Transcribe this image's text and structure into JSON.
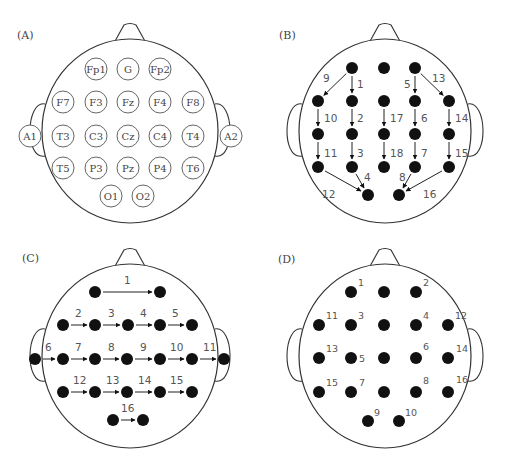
{
  "panels": [
    {
      "id": "A",
      "label": "(A)",
      "label_pos": [
        17,
        39
      ],
      "head": {
        "cx": 130,
        "cy": 131,
        "rx": 88,
        "ry": 92
      },
      "electrodes": [
        {
          "name": "Fp1",
          "x": 96,
          "y": 69
        },
        {
          "name": "G",
          "x": 128,
          "y": 69
        },
        {
          "name": "Fp2",
          "x": 160,
          "y": 69
        },
        {
          "name": "F7",
          "x": 63,
          "y": 102
        },
        {
          "name": "F3",
          "x": 96,
          "y": 102
        },
        {
          "name": "Fz",
          "x": 128,
          "y": 102
        },
        {
          "name": "F4",
          "x": 160,
          "y": 102
        },
        {
          "name": "F8",
          "x": 193,
          "y": 102
        },
        {
          "name": "A1",
          "x": 30,
          "y": 136
        },
        {
          "name": "T3",
          "x": 63,
          "y": 136
        },
        {
          "name": "C3",
          "x": 96,
          "y": 136
        },
        {
          "name": "Cz",
          "x": 128,
          "y": 136
        },
        {
          "name": "C4",
          "x": 160,
          "y": 136
        },
        {
          "name": "T4",
          "x": 193,
          "y": 136
        },
        {
          "name": "A2",
          "x": 231,
          "y": 136
        },
        {
          "name": "T5",
          "x": 63,
          "y": 168
        },
        {
          "name": "P3",
          "x": 96,
          "y": 168
        },
        {
          "name": "Pz",
          "x": 128,
          "y": 168
        },
        {
          "name": "P4",
          "x": 160,
          "y": 168
        },
        {
          "name": "T6",
          "x": 193,
          "y": 168
        },
        {
          "name": "O1",
          "x": 111,
          "y": 196
        },
        {
          "name": "O2",
          "x": 143,
          "y": 196
        }
      ]
    },
    {
      "id": "B",
      "label": "(B)",
      "label_pos": [
        279,
        39
      ],
      "head": {
        "cx": 385,
        "cy": 131,
        "rx": 86,
        "ry": 92
      },
      "dots": [
        [
          352,
          68
        ],
        [
          384,
          68
        ],
        [
          415,
          68
        ],
        [
          318,
          101
        ],
        [
          352,
          101
        ],
        [
          384,
          101
        ],
        [
          415,
          101
        ],
        [
          449,
          101
        ],
        [
          318,
          134
        ],
        [
          352,
          134
        ],
        [
          384,
          134
        ],
        [
          415,
          134
        ],
        [
          449,
          134
        ],
        [
          318,
          167
        ],
        [
          352,
          167
        ],
        [
          384,
          167
        ],
        [
          415,
          167
        ],
        [
          449,
          167
        ],
        [
          368,
          195
        ],
        [
          399,
          195
        ]
      ],
      "arrows": [
        {
          "n": "1",
          "from": [
            352,
            68
          ],
          "to": [
            352,
            101
          ],
          "lx": 357,
          "ly": 88
        },
        {
          "n": "2",
          "from": [
            352,
            101
          ],
          "to": [
            352,
            134
          ],
          "lx": 357,
          "ly": 122
        },
        {
          "n": "3",
          "from": [
            352,
            134
          ],
          "to": [
            352,
            167
          ],
          "lx": 357,
          "ly": 157
        },
        {
          "n": "4",
          "from": [
            352,
            167
          ],
          "to": [
            368,
            195
          ],
          "lx": 364,
          "ly": 181
        },
        {
          "n": "5",
          "from": [
            415,
            68
          ],
          "to": [
            415,
            101
          ],
          "lx": 404,
          "ly": 88
        },
        {
          "n": "6",
          "from": [
            415,
            101
          ],
          "to": [
            415,
            134
          ],
          "lx": 421,
          "ly": 122
        },
        {
          "n": "7",
          "from": [
            415,
            134
          ],
          "to": [
            415,
            167
          ],
          "lx": 421,
          "ly": 157
        },
        {
          "n": "8",
          "from": [
            415,
            167
          ],
          "to": [
            399,
            195
          ],
          "lx": 399,
          "ly": 181
        },
        {
          "n": "9",
          "from": [
            352,
            68
          ],
          "to": [
            318,
            101
          ],
          "lx": 323,
          "ly": 82
        },
        {
          "n": "10",
          "from": [
            318,
            101
          ],
          "to": [
            318,
            134
          ],
          "lx": 324,
          "ly": 122
        },
        {
          "n": "11",
          "from": [
            318,
            134
          ],
          "to": [
            318,
            167
          ],
          "lx": 324,
          "ly": 157
        },
        {
          "n": "12",
          "from": [
            318,
            167
          ],
          "to": [
            368,
            195
          ],
          "lx": 322,
          "ly": 198
        },
        {
          "n": "13",
          "from": [
            415,
            68
          ],
          "to": [
            449,
            101
          ],
          "lx": 432,
          "ly": 82
        },
        {
          "n": "14",
          "from": [
            449,
            101
          ],
          "to": [
            449,
            134
          ],
          "lx": 455,
          "ly": 122
        },
        {
          "n": "15",
          "from": [
            449,
            134
          ],
          "to": [
            449,
            167
          ],
          "lx": 455,
          "ly": 157
        },
        {
          "n": "16",
          "from": [
            449,
            167
          ],
          "to": [
            399,
            195
          ],
          "lx": 423,
          "ly": 198
        },
        {
          "n": "17",
          "from": [
            384,
            101
          ],
          "to": [
            384,
            134
          ],
          "lx": 390,
          "ly": 122
        },
        {
          "n": "18",
          "from": [
            384,
            134
          ],
          "to": [
            384,
            167
          ],
          "lx": 390,
          "ly": 157
        }
      ]
    },
    {
      "id": "C",
      "label": "(C)",
      "label_pos": [
        22,
        262
      ],
      "head": {
        "cx": 130,
        "cy": 356,
        "rx": 88,
        "ry": 92
      },
      "dots": [
        [
          95,
          292
        ],
        [
          160,
          292
        ],
        [
          63,
          325
        ],
        [
          95,
          325
        ],
        [
          128,
          325
        ],
        [
          160,
          325
        ],
        [
          192,
          325
        ],
        [
          35,
          359
        ],
        [
          63,
          359
        ],
        [
          95,
          359
        ],
        [
          127,
          359
        ],
        [
          160,
          359
        ],
        [
          192,
          359
        ],
        [
          224,
          359
        ],
        [
          63,
          392
        ],
        [
          95,
          392
        ],
        [
          127,
          392
        ],
        [
          160,
          392
        ],
        [
          192,
          392
        ],
        [
          113,
          420
        ],
        [
          143,
          420
        ]
      ],
      "arrows": [
        {
          "n": "1",
          "from": [
            95,
            292
          ],
          "to": [
            160,
            292
          ],
          "lx": 124,
          "ly": 284
        },
        {
          "n": "2",
          "from": [
            63,
            325
          ],
          "to": [
            95,
            325
          ],
          "lx": 75,
          "ly": 317
        },
        {
          "n": "3",
          "from": [
            95,
            325
          ],
          "to": [
            128,
            325
          ],
          "lx": 108,
          "ly": 317
        },
        {
          "n": "4",
          "from": [
            128,
            325
          ],
          "to": [
            160,
            325
          ],
          "lx": 140,
          "ly": 317
        },
        {
          "n": "5",
          "from": [
            160,
            325
          ],
          "to": [
            192,
            325
          ],
          "lx": 172,
          "ly": 317
        },
        {
          "n": "6",
          "from": [
            35,
            359
          ],
          "to": [
            63,
            359
          ],
          "lx": 45,
          "ly": 351
        },
        {
          "n": "7",
          "from": [
            63,
            359
          ],
          "to": [
            95,
            359
          ],
          "lx": 75,
          "ly": 351
        },
        {
          "n": "8",
          "from": [
            95,
            359
          ],
          "to": [
            127,
            359
          ],
          "lx": 108,
          "ly": 351
        },
        {
          "n": "9",
          "from": [
            127,
            359
          ],
          "to": [
            160,
            359
          ],
          "lx": 140,
          "ly": 351
        },
        {
          "n": "10",
          "from": [
            160,
            359
          ],
          "to": [
            192,
            359
          ],
          "lx": 170,
          "ly": 351
        },
        {
          "n": "11",
          "from": [
            192,
            359
          ],
          "to": [
            224,
            359
          ],
          "lx": 203,
          "ly": 351
        },
        {
          "n": "12",
          "from": [
            63,
            392
          ],
          "to": [
            95,
            392
          ],
          "lx": 73,
          "ly": 384
        },
        {
          "n": "13",
          "from": [
            95,
            392
          ],
          "to": [
            127,
            392
          ],
          "lx": 106,
          "ly": 384
        },
        {
          "n": "14",
          "from": [
            127,
            392
          ],
          "to": [
            160,
            392
          ],
          "lx": 138,
          "ly": 384
        },
        {
          "n": "15",
          "from": [
            160,
            392
          ],
          "to": [
            192,
            392
          ],
          "lx": 170,
          "ly": 384
        },
        {
          "n": "16",
          "from": [
            113,
            420
          ],
          "to": [
            143,
            420
          ],
          "lx": 121,
          "ly": 412
        }
      ]
    },
    {
      "id": "D",
      "label": "(D)",
      "label_pos": [
        278,
        263
      ],
      "head": {
        "cx": 385,
        "cy": 356,
        "rx": 86,
        "ry": 92
      },
      "dots": [
        {
          "x": 351,
          "y": 292,
          "n": "1",
          "dx": 7,
          "dy": -6
        },
        {
          "x": 384,
          "y": 292,
          "n": "",
          "dx": 0,
          "dy": 0
        },
        {
          "x": 416,
          "y": 292,
          "n": "2",
          "dx": 7,
          "dy": -6
        },
        {
          "x": 319,
          "y": 325,
          "n": "11",
          "dx": 7,
          "dy": -6
        },
        {
          "x": 351,
          "y": 325,
          "n": "3",
          "dx": 7,
          "dy": -6
        },
        {
          "x": 384,
          "y": 325,
          "n": "",
          "dx": 0,
          "dy": 0
        },
        {
          "x": 416,
          "y": 325,
          "n": "4",
          "dx": 7,
          "dy": -6
        },
        {
          "x": 448,
          "y": 325,
          "n": "12",
          "dx": 7,
          "dy": -6
        },
        {
          "x": 319,
          "y": 358,
          "n": "13",
          "dx": 7,
          "dy": -6
        },
        {
          "x": 351,
          "y": 358,
          "n": "5",
          "dx": 8,
          "dy": 4
        },
        {
          "x": 384,
          "y": 358,
          "n": "",
          "dx": 0,
          "dy": 0
        },
        {
          "x": 416,
          "y": 358,
          "n": "6",
          "dx": 7,
          "dy": -8
        },
        {
          "x": 448,
          "y": 358,
          "n": "14",
          "dx": 8,
          "dy": -6
        },
        {
          "x": 319,
          "y": 392,
          "n": "15",
          "dx": 7,
          "dy": -6
        },
        {
          "x": 351,
          "y": 392,
          "n": "7",
          "dx": 8,
          "dy": -6
        },
        {
          "x": 384,
          "y": 392,
          "n": "",
          "dx": 0,
          "dy": 0
        },
        {
          "x": 416,
          "y": 392,
          "n": "8",
          "dx": 7,
          "dy": -8
        },
        {
          "x": 448,
          "y": 392,
          "n": "16",
          "dx": 8,
          "dy": -9
        },
        {
          "x": 368,
          "y": 421,
          "n": "9",
          "dx": 6,
          "dy": -5
        },
        {
          "x": 399,
          "y": 421,
          "n": "10",
          "dx": 6,
          "dy": -5
        }
      ]
    }
  ]
}
